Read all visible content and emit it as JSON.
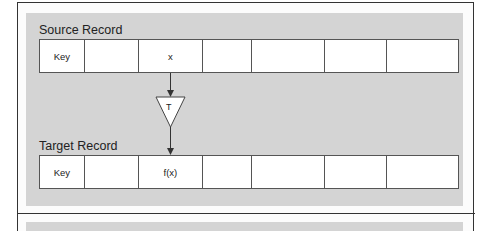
{
  "diagram": {
    "source": {
      "label": "Source Record",
      "cells": [
        "Key",
        "",
        "x",
        "",
        "",
        "",
        ""
      ]
    },
    "transform": {
      "label": "T"
    },
    "target": {
      "label": "Target Record",
      "cells": [
        "Key",
        "",
        "f(x)",
        "",
        "",
        "",
        ""
      ]
    },
    "colors": {
      "panel": "#d4d4d4",
      "border": "#333333",
      "cell_fill": "#ffffff"
    }
  }
}
